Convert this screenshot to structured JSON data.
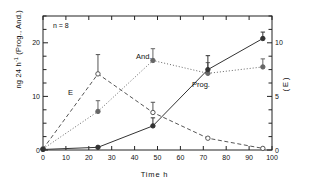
{
  "figure": {
    "annotation": "n = 8",
    "xlabel": "Time  h",
    "ylabel_left_main": "ng 24 h",
    "ylabel_left_sup": "-1",
    "ylabel_left_tail": " (Prog., And.)",
    "ylabel_right": "( E )",
    "series_labels": {
      "e": "E",
      "and": "And.",
      "prog": "Prog."
    }
  },
  "axes": {
    "x": {
      "min": 0,
      "max": 100,
      "tick_step": 10,
      "ticks": [
        0,
        10,
        20,
        30,
        40,
        50,
        60,
        70,
        80,
        90,
        100
      ],
      "tick_labels": [
        "0",
        "10",
        "20",
        "30",
        "40",
        "50",
        "60",
        "70",
        "80",
        "90",
        "100"
      ]
    },
    "y_left": {
      "min": 0,
      "max": 25,
      "tick_step": 2.5,
      "labeled_ticks": [
        0,
        10,
        20
      ],
      "tick_labels": [
        "0",
        "10",
        "20"
      ]
    },
    "y_right": {
      "min": 0,
      "max": 12.5,
      "tick_step": 1.25,
      "labeled_ticks": [
        0,
        5,
        10
      ],
      "tick_labels": [
        "0",
        "5",
        "10"
      ]
    }
  },
  "chart_data": {
    "type": "line",
    "title": "",
    "xlabel": "Time  h",
    "ylabel": "ng 24 h-1 (Prog., And.)",
    "ylabel_secondary": "( E )",
    "xlim": [
      0,
      100
    ],
    "ylim": [
      0,
      25
    ],
    "ylim_secondary": [
      0,
      12.5
    ],
    "grid": false,
    "legend": "inline-annotations",
    "annotations": [
      "n = 8"
    ],
    "series": [
      {
        "name": "E",
        "axis": "right",
        "linestyle": "dashed",
        "marker": "open-circle",
        "color": "#555555",
        "x": [
          0,
          24,
          48,
          72,
          96
        ],
        "values": [
          0.1,
          7.1,
          3.5,
          1.1,
          0.15
        ],
        "values_left_scale": [
          0.2,
          14.2,
          7.0,
          2.2,
          0.3
        ],
        "errors_left_scale": [
          0,
          3.6,
          1.9,
          0,
          0
        ]
      },
      {
        "name": "And.",
        "axis": "left",
        "linestyle": "dotted",
        "marker": "filled-circle",
        "color": "#666666",
        "x": [
          0,
          24,
          48,
          72,
          96
        ],
        "values": [
          0.2,
          7.2,
          16.7,
          14.3,
          15.5
        ],
        "errors": [
          0,
          2.0,
          2.2,
          2.0,
          1.5
        ]
      },
      {
        "name": "Prog.",
        "axis": "left",
        "linestyle": "solid",
        "marker": "filled-circle",
        "color": "#333333",
        "x": [
          0,
          24,
          48,
          72,
          96
        ],
        "values": [
          0.1,
          0.5,
          4.5,
          15.0,
          20.8
        ],
        "errors": [
          0,
          0,
          1.5,
          2.6,
          1.2
        ]
      }
    ]
  },
  "geometry": {
    "plot_left": 43,
    "plot_right": 272,
    "plot_top": 16,
    "plot_bottom": 150
  }
}
